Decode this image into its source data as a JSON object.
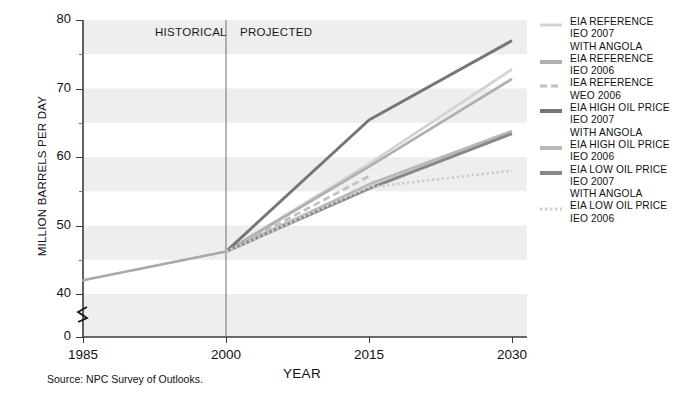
{
  "chart_data": {
    "type": "line",
    "title": "",
    "xlabel": "YEAR",
    "ylabel": "MILLION BARRELS PER DAY",
    "x": [
      1985,
      2000,
      2015,
      2030
    ],
    "xlim": [
      1985,
      2030
    ],
    "ylim": [
      40,
      80
    ],
    "y_axis_break": true,
    "y_axis_break_from": 0,
    "y_ticks": [
      80,
      70,
      60,
      50,
      40,
      0
    ],
    "y_minor_ticks": [
      75,
      65,
      55,
      45
    ],
    "x_ticks": [
      1985,
      2000,
      2015,
      2030
    ],
    "grid": "horizontal-bands",
    "legend_position": "right",
    "annotations": [
      {
        "text": "HISTORICAL",
        "x": 2000,
        "align": "left-of-divider"
      },
      {
        "text": "PROJECTED",
        "x": 2000,
        "align": "right-of-divider"
      },
      {
        "text": "divider",
        "x": 2000,
        "type": "vertical-line"
      }
    ],
    "historical_series": {
      "name": "HISTORICAL",
      "x": [
        1985,
        2000
      ],
      "values": [
        42.0,
        46.2
      ],
      "color": "#a8a8a8",
      "width": 2.6,
      "dash": "solid"
    },
    "series": [
      {
        "name": "EIA REFERENCE IEO 2007 WITH ANGOLA",
        "label_lines": [
          "EIA REFERENCE",
          "IEO 2007",
          "WITH ANGOLA"
        ],
        "x": [
          2000,
          2015,
          2030
        ],
        "values": [
          46.2,
          59.0,
          72.8
        ],
        "color": "#d2d2d2",
        "width": 2.6,
        "dash": "solid"
      },
      {
        "name": "EIA REFERENCE IEO 2006",
        "label_lines": [
          "EIA REFERENCE",
          "IEO 2006"
        ],
        "x": [
          2000,
          2015,
          2030
        ],
        "values": [
          46.2,
          58.6,
          71.4
        ],
        "color": "#b0b0b0",
        "width": 2.8,
        "dash": "solid"
      },
      {
        "name": "IEA REFERENCE WEO 2006",
        "label_lines": [
          "IEA REFERENCE",
          "WEO 2006"
        ],
        "x": [
          2000,
          2015
        ],
        "values": [
          46.2,
          57.2
        ],
        "color": "#c0c0c0",
        "width": 2.6,
        "dash": "dashed"
      },
      {
        "name": "EIA HIGH OIL PRICE IEO 2007 WITH ANGOLA",
        "label_lines": [
          "EIA HIGH OIL PRICE",
          "IEO 2007",
          "WITH ANGOLA"
        ],
        "x": [
          2000,
          2015,
          2030
        ],
        "values": [
          46.2,
          65.4,
          77.0
        ],
        "color": "#767676",
        "width": 3.0,
        "dash": "solid"
      },
      {
        "name": "EIA HIGH OIL PRICE IEO 2006",
        "label_lines": [
          "EIA HIGH OIL PRICE",
          "IEO 2006"
        ],
        "x": [
          2000,
          2015,
          2030
        ],
        "values": [
          46.2,
          56.0,
          63.8
        ],
        "color": "#b8b8b8",
        "width": 2.8,
        "dash": "solid"
      },
      {
        "name": "EIA LOW OIL PRICE IEO 2007 WITH ANGOLA",
        "label_lines": [
          "EIA LOW OIL PRICE",
          "IEO 2007",
          "WITH ANGOLA"
        ],
        "x": [
          2000,
          2015,
          2030
        ],
        "values": [
          46.2,
          55.4,
          63.4
        ],
        "color": "#888888",
        "width": 3.0,
        "dash": "solid"
      },
      {
        "name": "EIA LOW OIL PRICE IEO 2006",
        "label_lines": [
          "EIA LOW OIL PRICE",
          "IEO 2006"
        ],
        "x": [
          2000,
          2015,
          2030
        ],
        "values": [
          46.2,
          55.6,
          58.0
        ],
        "color": "#cccccc",
        "width": 2.6,
        "dash": "dotted"
      }
    ]
  },
  "axis": {
    "y_label": "MILLION BARRELS PER DAY",
    "x_label": "YEAR",
    "y_ticks": [
      "80",
      "70",
      "60",
      "50",
      "40",
      "0"
    ],
    "x_ticks": [
      "1985",
      "2000",
      "2015",
      "2030"
    ]
  },
  "annotations": {
    "historical": "HISTORICAL",
    "projected": "PROJECTED"
  },
  "source": {
    "text": "Source:  NPC Survey of Outlooks."
  },
  "legend": {
    "items": [
      {
        "lines": [
          "EIA REFERENCE",
          "IEO 2007",
          "WITH ANGOLA"
        ],
        "color": "#d2d2d2",
        "width": 3,
        "dash": "solid"
      },
      {
        "lines": [
          "EIA REFERENCE",
          "IEO 2006"
        ],
        "color": "#b0b0b0",
        "width": 4,
        "dash": "solid"
      },
      {
        "lines": [
          "IEA REFERENCE",
          "WEO 2006"
        ],
        "color": "#c0c0c0",
        "width": 3,
        "dash": "dashed"
      },
      {
        "lines": [
          "EIA HIGH OIL PRICE",
          "IEO 2007",
          "WITH ANGOLA"
        ],
        "color": "#767676",
        "width": 4,
        "dash": "solid"
      },
      {
        "lines": [
          "EIA HIGH OIL PRICE",
          "IEO 2006"
        ],
        "color": "#b8b8b8",
        "width": 4,
        "dash": "solid"
      },
      {
        "lines": [
          "EIA LOW OIL PRICE",
          "IEO 2007",
          "WITH ANGOLA"
        ],
        "color": "#888888",
        "width": 4,
        "dash": "solid"
      },
      {
        "lines": [
          "EIA LOW OIL PRICE",
          "IEO 2006"
        ],
        "color": "#cccccc",
        "width": 3,
        "dash": "dotted"
      }
    ]
  },
  "colors": {
    "band": "#eeeeee",
    "axis": "#3a3a3a",
    "text": "#111111"
  }
}
